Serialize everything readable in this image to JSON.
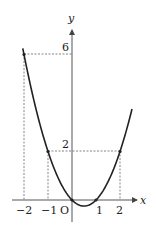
{
  "figure": {
    "function": "y = x^2 - x",
    "axis_labels": {
      "x": "x",
      "y": "y",
      "origin": "O"
    },
    "x_ticks": [
      {
        "value": -2,
        "label": "−2"
      },
      {
        "value": -1,
        "label": "−1"
      },
      {
        "value": 1,
        "label": "1"
      },
      {
        "value": 2,
        "label": "2"
      }
    ],
    "y_ticks": [
      {
        "value": 2,
        "label": "2"
      },
      {
        "value": 6,
        "label": "6"
      }
    ],
    "marked_points": [
      {
        "x": -2,
        "y": 6
      },
      {
        "x": -1,
        "y": 2
      },
      {
        "x": 2,
        "y": 2
      },
      {
        "x": 0,
        "y": 0
      },
      {
        "x": 1,
        "y": 0
      }
    ],
    "x_range": [
      -2.05,
      2.5
    ],
    "colors": {
      "curve": "#222222",
      "axis": "#555555",
      "guide": "#555555"
    }
  }
}
